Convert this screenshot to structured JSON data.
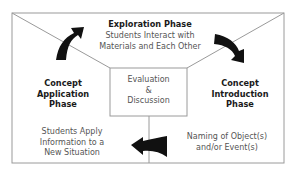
{
  "diagram": {
    "colors": {
      "line": "#9a9a9a",
      "arrow": "#111111",
      "heading": "#1a1a1a",
      "body": "#555555"
    },
    "exploration": {
      "heading": "Exploration Phase",
      "line1": "Students Interact with",
      "line2": "Materials and Each Other"
    },
    "introduction": {
      "heading_line1": "Concept",
      "heading_line2": "Introduction",
      "heading_line3": "Phase",
      "line1": "Naming of Object(s)",
      "line2": "and/or Event(s)"
    },
    "application": {
      "heading_line1": "Concept",
      "heading_line2": "Application",
      "heading_line3": "Phase",
      "line1": "Students Apply",
      "line2": "Information to a",
      "line3": "New Situation"
    },
    "center": {
      "line1": "Evaluation",
      "line2": "&",
      "line3": "Discussion"
    },
    "arrows": [
      {
        "name": "application-to-exploration",
        "direction": "up-right"
      },
      {
        "name": "exploration-to-introduction",
        "direction": "down-right"
      },
      {
        "name": "introduction-to-application",
        "direction": "left"
      }
    ]
  }
}
